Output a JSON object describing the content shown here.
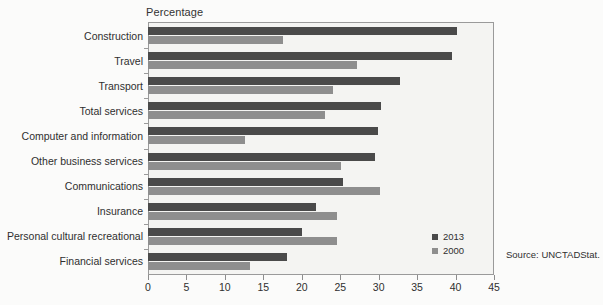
{
  "figure": {
    "axis_title": "Percentage",
    "source_note": "Source: UNCTADStat."
  },
  "legend": {
    "position": "inside-bottom-right",
    "items": [
      {
        "label": "2013",
        "color": "#4a4a4a"
      },
      {
        "label": "2000",
        "color": "#8e8e8e"
      }
    ]
  },
  "chart_data": {
    "type": "bar",
    "orientation": "horizontal",
    "title": "",
    "subtitle": "",
    "xlabel": "Percentage",
    "ylabel": "",
    "xlim": [
      0,
      45
    ],
    "xticks": [
      0,
      5,
      10,
      15,
      20,
      25,
      30,
      35,
      40,
      45
    ],
    "xtick_labels": [
      "0",
      "5",
      "10",
      "15",
      "20",
      "25",
      "30",
      "35",
      "40",
      "45"
    ],
    "grid": false,
    "legend_entries": [
      "2013",
      "2000"
    ],
    "categories": [
      "Construction",
      "Travel",
      "Transport",
      "Total services",
      "Computer and information",
      "Other business services",
      "Communications",
      "Insurance",
      "Personal cultural recreational",
      "Financial services"
    ],
    "series": [
      {
        "name": "2013",
        "color": "#4a4a4a",
        "values": [
          40.2,
          39.6,
          32.8,
          30.3,
          29.9,
          29.5,
          25.3,
          21.9,
          20.0,
          18.1
        ]
      },
      {
        "name": "2000",
        "color": "#8e8e8e",
        "values": [
          17.6,
          27.2,
          24.1,
          23.0,
          12.6,
          25.1,
          30.2,
          24.6,
          24.6,
          13.3
        ]
      }
    ]
  }
}
